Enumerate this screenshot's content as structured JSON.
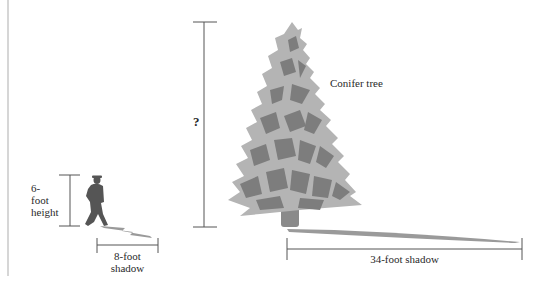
{
  "diagram": {
    "type": "similar-triangles shadow problem",
    "labels": {
      "tree": "Conifer tree",
      "unknown_height": "?",
      "person_height_line1": "6-",
      "person_height_line2": "foot",
      "person_height_line3": "height",
      "person_shadow_line1": "8-foot",
      "person_shadow_line2": "shadow",
      "tree_shadow": "34-foot shadow"
    },
    "values": {
      "person_height_ft": 6,
      "person_shadow_ft": 8,
      "tree_shadow_ft": 34,
      "tree_height_ft": "?"
    },
    "colors": {
      "tree_light": "#b4b4b4",
      "tree_dark": "#7d7d7d",
      "person": "#555555",
      "shadow": "#9a9a9a",
      "dimension_line": "#555555",
      "margin_rule": "#c8c8c8"
    }
  }
}
